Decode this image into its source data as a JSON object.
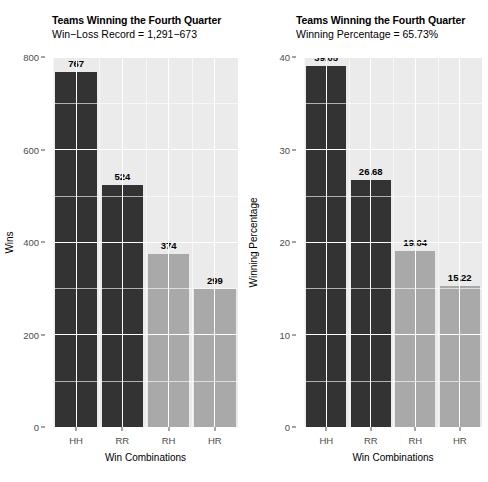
{
  "chart_data": [
    {
      "type": "bar",
      "panel": "left",
      "title": "Teams Winning the Fourth Quarter",
      "subtitle": "Win−Loss Record = 1,291−673",
      "xlabel": "Win Combinations",
      "ylabel": "Wins",
      "categories": [
        "HH",
        "RR",
        "RH",
        "HR"
      ],
      "values": [
        767,
        524,
        374,
        299
      ],
      "value_labels": [
        "767",
        "524",
        "374",
        "299"
      ],
      "bar_colors": [
        "#333333",
        "#333333",
        "#a9a9a9",
        "#a9a9a9"
      ],
      "ylim": [
        0,
        800
      ],
      "yticks": [
        0,
        200,
        400,
        600,
        800
      ],
      "ytick_labels": [
        "0",
        "200",
        "400",
        "600",
        "800"
      ],
      "yminor": [
        100,
        300,
        500,
        700
      ],
      "grid": true,
      "legend": "none"
    },
    {
      "type": "bar",
      "panel": "right",
      "title": "Teams Winning the Fourth Quarter",
      "subtitle": "Winning Percentage = 65.73%",
      "xlabel": "Win Combinations",
      "ylabel": "Winning Percentage",
      "categories": [
        "HH",
        "RR",
        "RH",
        "HR"
      ],
      "values": [
        39.05,
        26.68,
        19.04,
        15.22
      ],
      "value_labels": [
        "39.05",
        "26.68",
        "19.04",
        "15.22"
      ],
      "bar_colors": [
        "#333333",
        "#333333",
        "#a9a9a9",
        "#a9a9a9"
      ],
      "ylim": [
        0,
        40
      ],
      "yticks": [
        0,
        10,
        20,
        30,
        40
      ],
      "ytick_labels": [
        "0",
        "10",
        "20",
        "30",
        "40"
      ],
      "yminor": [
        5,
        15,
        25,
        35
      ],
      "grid": true,
      "legend": "none"
    }
  ],
  "colors": {
    "panel_background": "#ebebeb",
    "gridline": "#ffffff",
    "bar_dark": "#333333",
    "bar_light": "#a9a9a9",
    "axis_text": "#4d4d4d",
    "title_text": "#000000",
    "figure_background": "#ffffff"
  }
}
